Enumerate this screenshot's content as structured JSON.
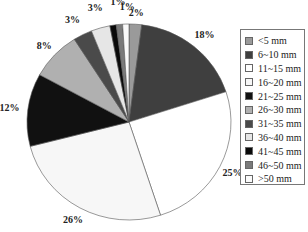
{
  "chart_data": {
    "type": "pie",
    "title": "",
    "categories": [
      "<5 mm",
      "6~10 mm",
      "11~15 mm",
      "16~20 mm",
      "21~25 mm",
      "26~30 mm",
      "31~35 mm",
      "36~40 mm",
      "41~45 mm",
      "46~50 mm",
      ">50 mm"
    ],
    "values": [
      2,
      18,
      25,
      26,
      12,
      8,
      3,
      3,
      1,
      1,
      1
    ],
    "labels": [
      "2%",
      "18%",
      "25%",
      "26%",
      "12%",
      "8%",
      "3%",
      "3%",
      "1%",
      "1%",
      "1%"
    ],
    "colors": [
      "#9a9a9a",
      "#3f3f3f",
      "#ffffff",
      "#f7f7f7",
      "#111111",
      "#b0b0b0",
      "#4a4a4a",
      "#e6e6e6",
      "#0a0a0a",
      "#7a7a7a",
      "#fafafa"
    ],
    "start_angle_deg": 0,
    "direction": "clockwise",
    "legend_position": "right"
  },
  "legend": {
    "items": [
      {
        "label": "<5 mm",
        "color": "#9a9a9a"
      },
      {
        "label": "6~10 mm",
        "color": "#3f3f3f"
      },
      {
        "label": "11~15 mm",
        "color": "#ffffff"
      },
      {
        "label": "16~20 mm",
        "color": "#f7f7f7"
      },
      {
        "label": "21~25 mm",
        "color": "#111111"
      },
      {
        "label": "26~30 mm",
        "color": "#b0b0b0"
      },
      {
        "label": "31~35 mm",
        "color": "#4a4a4a"
      },
      {
        "label": "36~40 mm",
        "color": "#e6e6e6"
      },
      {
        "label": "41~45 mm",
        "color": "#0a0a0a"
      },
      {
        "label": "46~50 mm",
        "color": "#7a7a7a"
      },
      {
        "label": ">50 mm",
        "color": "#fafafa"
      }
    ]
  }
}
